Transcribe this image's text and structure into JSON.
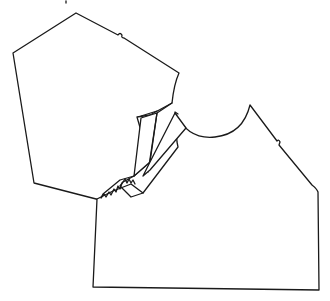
{
  "diagram": {
    "type": "line-drawing",
    "subject": "sewing pattern pieces",
    "stroke_color": "#1a1a1a",
    "background_color": "#ffffff",
    "pieces": [
      {
        "id": "sleeve",
        "label": "sleeve pattern piece",
        "features": [
          "shoulder notch",
          "pinked edge"
        ]
      },
      {
        "id": "facing",
        "label": "folded facing",
        "features": [
          "folded flap",
          "pinked edge"
        ]
      },
      {
        "id": "bodice",
        "label": "bodice front pattern piece",
        "features": [
          "neckline curve",
          "shoulder notch"
        ]
      }
    ]
  }
}
